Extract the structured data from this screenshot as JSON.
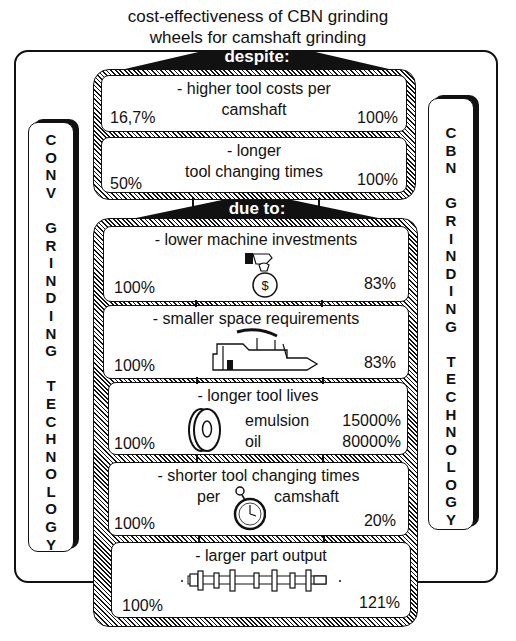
{
  "title": {
    "line1": "cost-effectiveness of CBN grinding",
    "line2": "wheels for camshaft grinding"
  },
  "despite": {
    "label": "despite:",
    "items": [
      {
        "title_line1": "- higher tool costs per",
        "title_line2": "camshaft",
        "left_value": "16,7%",
        "right_value": "100%"
      },
      {
        "title_line1": "- longer",
        "title_line2": "tool changing times",
        "left_value": "50%",
        "right_value": "100%"
      }
    ]
  },
  "due_to": {
    "label": "due to:",
    "items": [
      {
        "title": "- lower machine investments",
        "icon": "money-bag-hand-icon",
        "left_value": "100%",
        "right_value": "83%"
      },
      {
        "title": "- smaller space requirements",
        "icon": "factory-building-icon",
        "left_value": "100%",
        "right_value": "83%"
      },
      {
        "title": "- longer tool lives",
        "icon": "grinding-wheel-icon",
        "left_value": "100%",
        "right_rows": [
          {
            "label": "emulsion",
            "value": "15000%"
          },
          {
            "label": "oil",
            "value": "80000%"
          }
        ]
      },
      {
        "title": "- shorter tool changing times",
        "title_line2_left": "per",
        "title_line2_right": "camshaft",
        "icon": "stopwatch-icon",
        "left_value": "100%",
        "right_value": "20%"
      },
      {
        "title": "- larger part output",
        "icon": "camshaft-icon",
        "left_value": "100%",
        "right_value": "121%"
      }
    ]
  },
  "left_side": {
    "words": [
      "CONV",
      "GRINDING",
      "TECHNOLOGY"
    ]
  },
  "right_side": {
    "words": [
      "CBN",
      "GRINDING",
      "TECHNOLOGY"
    ]
  },
  "colors": {
    "ink": "#111111",
    "background": "#ffffff"
  }
}
